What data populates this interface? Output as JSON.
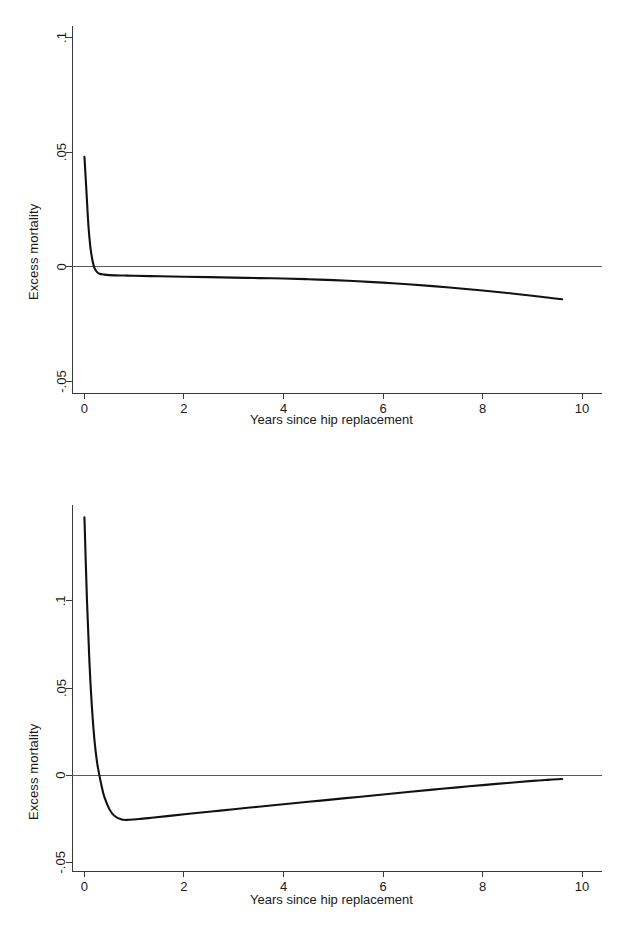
{
  "figure": {
    "background": "#ffffff",
    "curve_color": "#111111",
    "axis_color": "#3a3a3a",
    "reference_line_color": "#5a5a5a"
  },
  "chart_data": [
    {
      "type": "line",
      "panel": "top",
      "title": "",
      "xlabel": "Years since hip replacement",
      "ylabel": "Excess mortality",
      "xlim": [
        -0.25,
        10.4
      ],
      "ylim": [
        -0.055,
        0.105
      ],
      "xticks": [
        0,
        2,
        4,
        6,
        8,
        10
      ],
      "xticklabels": [
        "0",
        "2",
        "4",
        "6",
        "8",
        "10"
      ],
      "yticks": [
        0.1,
        0.05,
        0,
        -0.05
      ],
      "yticklabels": [
        ".1",
        ".05",
        "0",
        "-.05"
      ],
      "grid": false,
      "legend": "none",
      "reference_lines": [
        {
          "axis": "y",
          "value": 0
        }
      ],
      "series": [
        {
          "name": "Excess mortality",
          "x": [
            0.0,
            0.04,
            0.08,
            0.12,
            0.16,
            0.2,
            0.25,
            0.3,
            0.4,
            0.5,
            0.6,
            0.8,
            1.0,
            1.5,
            2.0,
            2.5,
            3.0,
            3.5,
            4.0,
            4.5,
            5.0,
            5.5,
            6.0,
            6.5,
            7.0,
            7.5,
            8.0,
            8.5,
            9.0,
            9.3,
            9.6
          ],
          "y": [
            0.048,
            0.033,
            0.018,
            0.0085,
            0.003,
            -0.0005,
            -0.0022,
            -0.003,
            -0.0034,
            -0.0036,
            -0.0037,
            -0.0038,
            -0.0039,
            -0.0041,
            -0.0043,
            -0.0045,
            -0.0047,
            -0.0049,
            -0.0051,
            -0.0054,
            -0.0058,
            -0.0063,
            -0.0069,
            -0.0076,
            -0.0084,
            -0.0093,
            -0.0103,
            -0.0114,
            -0.0126,
            -0.0134,
            -0.0141
          ]
        }
      ]
    },
    {
      "type": "line",
      "panel": "bottom",
      "title": "",
      "xlabel": "Years since hip replacement",
      "ylabel": "Excess mortality",
      "xlim": [
        -0.25,
        10.4
      ],
      "ylim": [
        -0.055,
        0.155
      ],
      "xticks": [
        0,
        2,
        4,
        6,
        8,
        10
      ],
      "xticklabels": [
        "0",
        "2",
        "4",
        "6",
        "8",
        "10"
      ],
      "yticks": [
        0.1,
        0.05,
        0,
        -0.05
      ],
      "yticklabels": [
        ".1",
        ".05",
        "0",
        "-.05"
      ],
      "grid": false,
      "legend": "none",
      "reference_lines": [
        {
          "axis": "y",
          "value": 0
        }
      ],
      "series": [
        {
          "name": "Excess mortality",
          "x": [
            0.0,
            0.05,
            0.1,
            0.15,
            0.2,
            0.25,
            0.3,
            0.35,
            0.4,
            0.5,
            0.6,
            0.75,
            0.9,
            1.1,
            1.4,
            1.8,
            2.2,
            2.6,
            3.0,
            3.5,
            4.0,
            4.5,
            5.0,
            5.5,
            6.0,
            6.5,
            7.0,
            7.5,
            8.0,
            8.5,
            9.0,
            9.3,
            9.6
          ],
          "y": [
            0.148,
            0.101,
            0.065,
            0.039,
            0.0205,
            0.008,
            0.0,
            -0.007,
            -0.0125,
            -0.0195,
            -0.0233,
            -0.0255,
            -0.0256,
            -0.0252,
            -0.0243,
            -0.0231,
            -0.0219,
            -0.0207,
            -0.0196,
            -0.0181,
            -0.0167,
            -0.0153,
            -0.0139,
            -0.0125,
            -0.0111,
            -0.0097,
            -0.0083,
            -0.007,
            -0.0057,
            -0.0045,
            -0.0033,
            -0.0027,
            -0.0022
          ]
        }
      ]
    }
  ]
}
